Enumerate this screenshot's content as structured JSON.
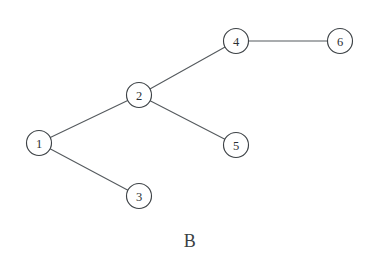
{
  "figure": {
    "caption": "B",
    "background_color": "#ffffff",
    "node_fill_color": "#ffffff",
    "node_stroke_color": "#3d4246",
    "edge_color": "#555a5e",
    "label_color": "#2b2f33"
  },
  "graph": {
    "type": "undirected-node-link-diagram",
    "node_radius": 12.5,
    "nodes": [
      {
        "id": "1",
        "label": "1",
        "x": 39,
        "y": 143
      },
      {
        "id": "2",
        "label": "2",
        "x": 139,
        "y": 95
      },
      {
        "id": "3",
        "label": "3",
        "x": 139,
        "y": 196
      },
      {
        "id": "4",
        "label": "4",
        "x": 236,
        "y": 41
      },
      {
        "id": "5",
        "label": "5",
        "x": 236,
        "y": 145
      },
      {
        "id": "6",
        "label": "6",
        "x": 340,
        "y": 41
      }
    ],
    "edges": [
      {
        "source": "1",
        "target": "2"
      },
      {
        "source": "1",
        "target": "3"
      },
      {
        "source": "2",
        "target": "4"
      },
      {
        "source": "2",
        "target": "5"
      },
      {
        "source": "4",
        "target": "6"
      }
    ]
  },
  "caption_position": {
    "x": 190,
    "y": 247
  }
}
